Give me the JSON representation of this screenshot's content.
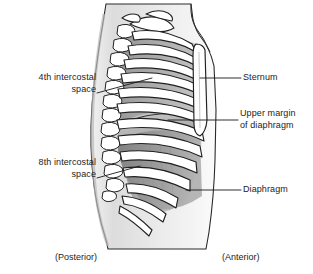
{
  "figure": {
    "background_color": "#ffffff",
    "line_color": "#1a1a1a",
    "bone_color": "#ffffff",
    "intercostal_shade": "#9a9a9a",
    "diaphragm_shade": "#8a8a8a",
    "body_shade": "#d9d9d9"
  },
  "labels": {
    "fourth_intercostal": "4th intercostal\nspace",
    "eighth_intercostal": "8th intercostal\nspace",
    "sternum": "Sternum",
    "upper_margin_of_diaphragm": "Upper margin\nof diaphragm",
    "diaphragm": "Diaphragm"
  },
  "captions": {
    "posterior": "(Posterior)",
    "anterior": "(Anterior)"
  },
  "icons": {
    "leader_line": "leader-line"
  }
}
